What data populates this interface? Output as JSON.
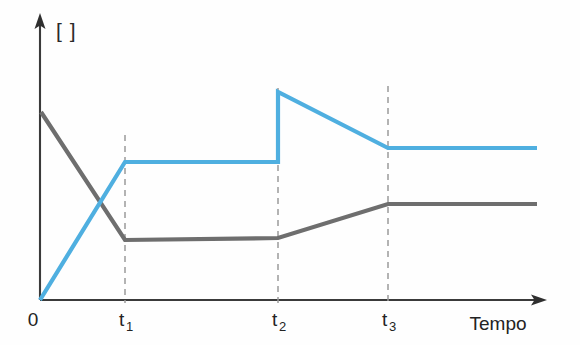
{
  "chart_data": {
    "type": "line",
    "title": "",
    "subtitle": "",
    "xlabel": "Tempo",
    "ylabel": "[ ]",
    "ylabel_unit_bracket": "[    ]",
    "grid": false,
    "legend": false,
    "legend_position": "none",
    "xlim": [
      0,
      1
    ],
    "ylim": [
      0,
      1
    ],
    "x_tick_labels": [
      "0",
      "t",
      "t",
      "t",
      "Tempo"
    ],
    "x_ticks": [
      {
        "label_base": "0",
        "label_sub": "",
        "x_px": 40
      },
      {
        "label_base": "t",
        "label_sub": "1",
        "x_px": 125
      },
      {
        "label_base": "t",
        "label_sub": "2",
        "x_px": 278
      },
      {
        "label_base": "t",
        "label_sub": "3",
        "x_px": 388
      }
    ],
    "y_tick_labels": [],
    "colors": {
      "series_blue": "#4FAFE0",
      "series_gray": "#6E6E6E",
      "axis": "#3a3a3a",
      "guide_dash": "#9a9a9a",
      "background": "#fefefe"
    },
    "series": [
      {
        "name": "blue-series",
        "color": "#4FAFE0",
        "points_px": [
          [
            40,
            300
          ],
          [
            125,
            162
          ],
          [
            278,
            162
          ],
          [
            278,
            92
          ],
          [
            388,
            148
          ],
          [
            537,
            148
          ]
        ],
        "description": "rises linearly from origin to t1, holds flat, jumps up at t2, decays to t3, holds flat"
      },
      {
        "name": "gray-series",
        "color": "#6E6E6E",
        "points_px": [
          [
            41,
            112
          ],
          [
            125,
            240
          ],
          [
            278,
            238
          ],
          [
            388,
            204
          ],
          [
            537,
            204
          ]
        ],
        "description": "falls linearly from initial value to t1, holds flat, rises from t2 to t3, holds flat"
      }
    ],
    "guides": [
      {
        "name": "guide-t1",
        "x_px": 125,
        "y_top_px": 135,
        "y_bottom_px": 302
      },
      {
        "name": "guide-t2",
        "x_px": 278,
        "y_top_px": 88,
        "y_bottom_px": 302
      },
      {
        "name": "guide-t3",
        "x_px": 388,
        "y_top_px": 86,
        "y_bottom_px": 302
      }
    ],
    "axes_px": {
      "y_axis_x": 40,
      "y_axis_top": 15,
      "y_axis_bottom": 300,
      "x_axis_y": 300,
      "x_axis_left": 40,
      "x_axis_right": 547
    }
  }
}
